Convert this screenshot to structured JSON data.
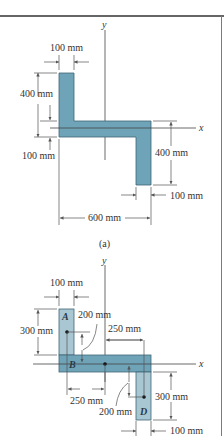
{
  "figure_a": {
    "caption": "(a)",
    "axis_x": "x",
    "axis_y": "y",
    "dims": {
      "top_width": "100 mm",
      "left_height": "400 mm",
      "left_lower": "100 mm",
      "right_height": "400 mm",
      "bottom_width": "100 mm",
      "total_width": "600 mm"
    }
  },
  "figure_b": {
    "axis_x": "x",
    "axis_y": "y",
    "parts": [
      "A",
      "B",
      "D"
    ],
    "dims": {
      "top_width": "100 mm",
      "left_height": "300 mm",
      "a_offset": "200 mm",
      "right_offset": "250 mm",
      "left_offset": "250 mm",
      "d_offset": "200 mm",
      "right_height": "300 mm",
      "bottom_width": "100 mm"
    }
  },
  "colors": {
    "fill": "#6fa3b8",
    "fill_light": "#a9c7d3",
    "stroke": "#3f6675"
  }
}
